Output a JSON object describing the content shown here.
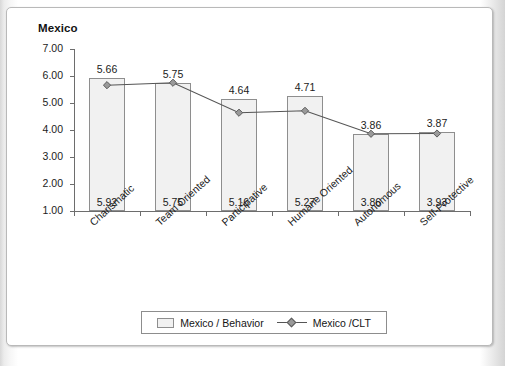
{
  "chart_data": {
    "type": "bar",
    "title": "Mexico",
    "xlabel": "",
    "ylabel": "",
    "ylim": [
      1.0,
      7.0
    ],
    "ytick_labels": [
      "7.00",
      "6.00",
      "5.00",
      "4.00",
      "3.00",
      "2.00",
      "1.00"
    ],
    "ytick_values": [
      7.0,
      6.0,
      5.0,
      4.0,
      3.0,
      2.0,
      1.0
    ],
    "grid": false,
    "legend_position": "bottom-center",
    "categories": [
      "Charismatic",
      "Team Oriented",
      "Participative",
      "Humane Oriented",
      "Autonomous",
      "Self-Protective"
    ],
    "series": [
      {
        "name": "Mexico / Behavior",
        "type": "bar",
        "values": [
          5.92,
          5.75,
          5.16,
          5.27,
          3.86,
          3.93
        ],
        "labels": [
          "5.92",
          "5.75",
          "5.16",
          "5.27",
          "3.86",
          "3.93"
        ],
        "label_position": "inside-bottom",
        "fill": "#f1f1f1",
        "stroke": "#8e8e8e"
      },
      {
        "name": "Mexico /CLT",
        "type": "line",
        "marker": "diamond",
        "values": [
          5.66,
          5.75,
          4.64,
          4.71,
          3.86,
          3.87
        ],
        "labels": [
          "5.66",
          "5.75",
          "4.64",
          "4.71",
          "3.86",
          "3.87"
        ],
        "label_position": "above",
        "stroke": "#555555",
        "marker_fill": "#9a9a9a"
      }
    ]
  },
  "legend": {
    "bar_label": "Mexico / Behavior",
    "line_label": "Mexico /CLT"
  }
}
